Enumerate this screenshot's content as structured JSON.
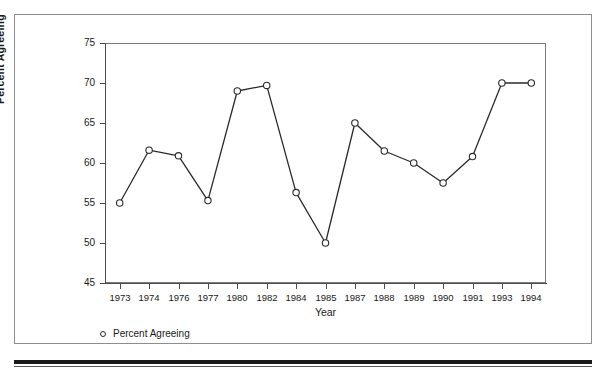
{
  "chart_data": {
    "type": "line",
    "title": "",
    "xlabel": "Year",
    "ylabel": "Percent Agreeing",
    "categories": [
      "1973",
      "1974",
      "1976",
      "1977",
      "1980",
      "1982",
      "1984",
      "1985",
      "1987",
      "1988",
      "1989",
      "1990",
      "1991",
      "1993",
      "1994"
    ],
    "values": [
      55.0,
      61.6,
      60.9,
      55.3,
      69.0,
      69.7,
      56.3,
      50.0,
      65.0,
      61.5,
      60.0,
      57.5,
      60.8,
      70.0,
      70.0
    ],
    "series": [
      {
        "name": "Percent Agreeing",
        "values": [
          55.0,
          61.6,
          60.9,
          55.3,
          69.0,
          69.7,
          56.3,
          50.0,
          65.0,
          61.5,
          60.0,
          57.5,
          60.8,
          70.0,
          70.0
        ]
      }
    ],
    "ylim": [
      45,
      75
    ],
    "yticks": [
      45,
      50,
      55,
      60,
      65,
      70,
      75
    ],
    "ytick_labels": [
      "45",
      "50",
      "55",
      "60",
      "65",
      "70",
      "75"
    ],
    "grid": false,
    "legend": {
      "position": "below-left",
      "entries": [
        {
          "label": "Percent Agreeing",
          "marker": "open-circle"
        }
      ]
    },
    "style": {
      "line_color": "#2b2b2b",
      "marker_face_color": "#ffffff",
      "marker_edge_color": "#2b2b2b",
      "axis_color": "#4d4d4d",
      "background": "#ffffff"
    }
  }
}
